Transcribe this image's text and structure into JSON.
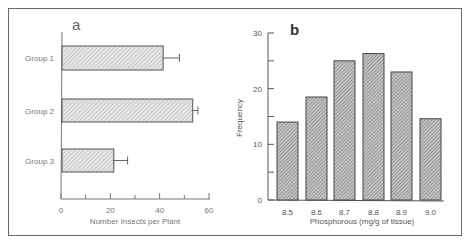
{
  "chart_data": [
    {
      "type": "bar",
      "orientation": "horizontal",
      "panel_label": "a",
      "title": "",
      "categories": [
        "Group 1",
        "Group 2",
        "Group 3"
      ],
      "values": [
        41,
        53,
        21
      ],
      "error": [
        7,
        2.5,
        6
      ],
      "xlabel": "Number Insects per Plant",
      "ylabel": "",
      "xlim": [
        0,
        60
      ],
      "xticks": [
        "0",
        "20",
        "40",
        "60"
      ],
      "grid": false,
      "legend": null
    },
    {
      "type": "bar",
      "panel_label": "b",
      "title": "",
      "categories": [
        "8.5",
        "8.6",
        "8.7",
        "8.8",
        "8.9",
        "9.0"
      ],
      "values": [
        14,
        18.5,
        25,
        26.3,
        23,
        14.6
      ],
      "xlabel": "Phosphorous  (mg/g of tissue)",
      "ylabel": "Frequency",
      "ylim": [
        0,
        30
      ],
      "yticks": [
        "0",
        "10",
        "20",
        "30"
      ],
      "grid": false,
      "legend": null
    }
  ],
  "colors": {
    "frame": "#6a6a6a",
    "bar_fill_a": "#d9d9d9",
    "bar_fill_b": "#9a9a9a",
    "axis": "#555555"
  }
}
